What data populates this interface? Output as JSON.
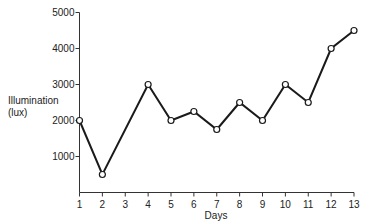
{
  "chart_data": {
    "type": "line",
    "title": "",
    "xlabel": "Days",
    "ylabel": "Illumination (lux)",
    "ylabel_lines": [
      "Illumination",
      "(lux)"
    ],
    "x": [
      1,
      2,
      4,
      5,
      6,
      7,
      8,
      9,
      10,
      11,
      12,
      13
    ],
    "values": [
      2000,
      500,
      3000,
      2000,
      2250,
      1750,
      2500,
      2000,
      3000,
      2500,
      4000,
      4500
    ],
    "x_ticks": [
      "1",
      "2",
      "3",
      "4",
      "5",
      "6",
      "7",
      "8",
      "9",
      "10",
      "11",
      "12",
      "13"
    ],
    "y_ticks": [
      "1000",
      "2000",
      "3000",
      "4000",
      "5000"
    ],
    "xlim": [
      1,
      13
    ],
    "ylim": [
      0,
      5000
    ],
    "grid": false,
    "legend": null,
    "markers": "open-circle",
    "line_color": "#1a1a1a"
  }
}
